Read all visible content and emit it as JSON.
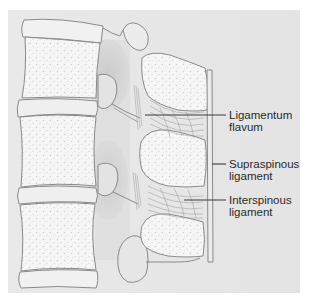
{
  "figure": {
    "colors": {
      "page_background": "#ffffff",
      "panel_background": "#e7e7e7",
      "canal_shadow": "#c9c9c9",
      "bone_fill": "#f6f6f6",
      "bone_stipple": "#d2d2d2",
      "disc_fill": "#efefef",
      "outline": "#8a8a8a",
      "leader_line": "#3a3a3a",
      "label_text": "#2a2a2a"
    }
  },
  "labels": [
    {
      "id": "ligamentum-flavum",
      "line1": "Ligamentum",
      "line2": "flavum"
    },
    {
      "id": "supraspinous-ligament",
      "line1": "Supraspinous",
      "line2": "ligament"
    },
    {
      "id": "interspinous-ligament",
      "line1": "Interspinous",
      "line2": "ligament"
    }
  ]
}
